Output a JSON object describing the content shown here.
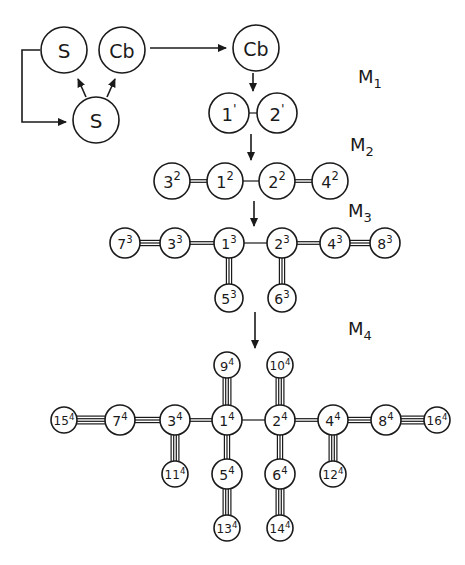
{
  "diagram": {
    "labels": [
      {
        "id": "M1",
        "text": "M",
        "sub": "1",
        "x": 358,
        "y": 83
      },
      {
        "id": "M2",
        "text": "M",
        "sub": "2",
        "x": 350,
        "y": 151
      },
      {
        "id": "M3",
        "text": "M",
        "sub": "3",
        "x": 348,
        "y": 217
      },
      {
        "id": "M4",
        "text": "M",
        "sub": "4",
        "x": 348,
        "y": 335
      }
    ],
    "nodes": [
      {
        "id": "S_top",
        "main": "S",
        "sup": "",
        "x": 64,
        "y": 50,
        "r": 23,
        "fs": 20
      },
      {
        "id": "Cb_top",
        "main": "Cb",
        "sup": "",
        "x": 122,
        "y": 50,
        "r": 23,
        "fs": 19
      },
      {
        "id": "S_bottom",
        "main": "S",
        "sup": "",
        "x": 96,
        "y": 120,
        "r": 23,
        "fs": 20
      },
      {
        "id": "Cb_right",
        "main": "Cb",
        "sup": "",
        "x": 256,
        "y": 48,
        "r": 23,
        "fs": 19
      },
      {
        "id": "1_1",
        "main": "1",
        "sup": "'",
        "x": 229,
        "y": 113,
        "r": 20,
        "fs": 18
      },
      {
        "id": "2_1",
        "main": "2",
        "sup": "'",
        "x": 277,
        "y": 113,
        "r": 20,
        "fs": 18
      },
      {
        "id": "3_2",
        "main": "3",
        "sup": "2",
        "x": 172,
        "y": 181,
        "r": 18,
        "fs": 16
      },
      {
        "id": "1_2",
        "main": "1",
        "sup": "2",
        "x": 225,
        "y": 181,
        "r": 18,
        "fs": 16
      },
      {
        "id": "2_2",
        "main": "2",
        "sup": "2",
        "x": 277,
        "y": 181,
        "r": 18,
        "fs": 16
      },
      {
        "id": "4_2",
        "main": "4",
        "sup": "2",
        "x": 330,
        "y": 181,
        "r": 18,
        "fs": 16
      },
      {
        "id": "7_3",
        "main": "7",
        "sup": "3",
        "x": 125,
        "y": 243,
        "r": 15,
        "fs": 14
      },
      {
        "id": "3_3",
        "main": "3",
        "sup": "3",
        "x": 175,
        "y": 243,
        "r": 15,
        "fs": 14
      },
      {
        "id": "1_3",
        "main": "1",
        "sup": "3",
        "x": 229,
        "y": 243,
        "r": 15,
        "fs": 14
      },
      {
        "id": "2_3",
        "main": "2",
        "sup": "3",
        "x": 282,
        "y": 243,
        "r": 15,
        "fs": 14
      },
      {
        "id": "4_3",
        "main": "4",
        "sup": "3",
        "x": 335,
        "y": 243,
        "r": 15,
        "fs": 14
      },
      {
        "id": "8_3",
        "main": "8",
        "sup": "3",
        "x": 385,
        "y": 243,
        "r": 15,
        "fs": 14
      },
      {
        "id": "5_3",
        "main": "5",
        "sup": "3",
        "x": 229,
        "y": 298,
        "r": 14,
        "fs": 14
      },
      {
        "id": "6_3",
        "main": "6",
        "sup": "3",
        "x": 282,
        "y": 298,
        "r": 14,
        "fs": 14
      },
      {
        "id": "9_4",
        "main": "9",
        "sup": "4",
        "x": 227,
        "y": 365,
        "r": 13,
        "fs": 13
      },
      {
        "id": "10_4",
        "main": "10",
        "sup": "4",
        "x": 280,
        "y": 365,
        "r": 13,
        "fs": 12
      },
      {
        "id": "15_4",
        "main": "15",
        "sup": "4",
        "x": 64,
        "y": 420,
        "r": 13,
        "fs": 12
      },
      {
        "id": "7_4",
        "main": "7",
        "sup": "4",
        "x": 120,
        "y": 420,
        "r": 15,
        "fs": 14
      },
      {
        "id": "3_4",
        "main": "3",
        "sup": "4",
        "x": 175,
        "y": 420,
        "r": 15,
        "fs": 14
      },
      {
        "id": "1_4",
        "main": "1",
        "sup": "4",
        "x": 227,
        "y": 420,
        "r": 15,
        "fs": 14
      },
      {
        "id": "2_4",
        "main": "2",
        "sup": "4",
        "x": 280,
        "y": 420,
        "r": 15,
        "fs": 14
      },
      {
        "id": "4_4",
        "main": "4",
        "sup": "4",
        "x": 333,
        "y": 420,
        "r": 15,
        "fs": 14
      },
      {
        "id": "8_4",
        "main": "8",
        "sup": "4",
        "x": 386,
        "y": 420,
        "r": 15,
        "fs": 14
      },
      {
        "id": "16_4",
        "main": "16",
        "sup": "4",
        "x": 437,
        "y": 420,
        "r": 13,
        "fs": 12
      },
      {
        "id": "11_4",
        "main": "11",
        "sup": "4",
        "x": 175,
        "y": 474,
        "r": 13,
        "fs": 12
      },
      {
        "id": "5_4",
        "main": "5",
        "sup": "4",
        "x": 227,
        "y": 474,
        "r": 15,
        "fs": 14
      },
      {
        "id": "6_4",
        "main": "6",
        "sup": "4",
        "x": 280,
        "y": 474,
        "r": 15,
        "fs": 14
      },
      {
        "id": "12_4",
        "main": "12",
        "sup": "4",
        "x": 333,
        "y": 474,
        "r": 13,
        "fs": 12
      },
      {
        "id": "13_4",
        "main": "13",
        "sup": "4",
        "x": 227,
        "y": 528,
        "r": 13,
        "fs": 12
      },
      {
        "id": "14_4",
        "main": "14",
        "sup": "4",
        "x": 280,
        "y": 528,
        "r": 13,
        "fs": 12
      }
    ],
    "bonds": [
      {
        "a": "1_1",
        "b": "2_1",
        "order": 1
      },
      {
        "a": "3_2",
        "b": "1_2",
        "order": 2
      },
      {
        "a": "1_2",
        "b": "2_2",
        "order": 1
      },
      {
        "a": "2_2",
        "b": "4_2",
        "order": 2
      },
      {
        "a": "7_3",
        "b": "3_3",
        "order": 3
      },
      {
        "a": "3_3",
        "b": "1_3",
        "order": 2
      },
      {
        "a": "1_3",
        "b": "2_3",
        "order": 1
      },
      {
        "a": "2_3",
        "b": "4_3",
        "order": 2
      },
      {
        "a": "4_3",
        "b": "8_3",
        "order": 3
      },
      {
        "a": "1_3",
        "b": "5_3",
        "order": 3
      },
      {
        "a": "2_3",
        "b": "6_3",
        "order": 3
      },
      {
        "a": "15_4",
        "b": "7_4",
        "order": 4
      },
      {
        "a": "7_4",
        "b": "3_4",
        "order": 3
      },
      {
        "a": "3_4",
        "b": "1_4",
        "order": 2
      },
      {
        "a": "1_4",
        "b": "2_4",
        "order": 1
      },
      {
        "a": "2_4",
        "b": "4_4",
        "order": 2
      },
      {
        "a": "4_4",
        "b": "8_4",
        "order": 3
      },
      {
        "a": "8_4",
        "b": "16_4",
        "order": 4
      },
      {
        "a": "9_4",
        "b": "1_4",
        "order": 4
      },
      {
        "a": "10_4",
        "b": "2_4",
        "order": 4
      },
      {
        "a": "3_4",
        "b": "11_4",
        "order": 4
      },
      {
        "a": "1_4",
        "b": "5_4",
        "order": 3
      },
      {
        "a": "2_4",
        "b": "6_4",
        "order": 3
      },
      {
        "a": "4_4",
        "b": "12_4",
        "order": 4
      },
      {
        "a": "5_4",
        "b": "13_4",
        "order": 4
      },
      {
        "a": "6_4",
        "b": "14_4",
        "order": 4
      }
    ],
    "arrows": [
      {
        "id": "loop-arrow",
        "points": [
          [
            40,
            50
          ],
          [
            22,
            50
          ],
          [
            22,
            122
          ],
          [
            66,
            122
          ]
        ]
      },
      {
        "id": "S-to-S-arrow",
        "points": [
          [
            86,
            97
          ],
          [
            78,
            79
          ]
        ]
      },
      {
        "id": "S-to-Cb-arrow",
        "points": [
          [
            107,
            97
          ],
          [
            115,
            79
          ]
        ]
      },
      {
        "id": "Cb-to-Cb-arrow",
        "points": [
          [
            150,
            48
          ],
          [
            226,
            48
          ]
        ]
      },
      {
        "id": "Cb-to-M1-arrow",
        "points": [
          [
            253,
            73
          ],
          [
            253,
            91
          ]
        ]
      },
      {
        "id": "M1-to-M2-arrow",
        "points": [
          [
            251,
            134
          ],
          [
            251,
            160
          ]
        ]
      },
      {
        "id": "M2-to-M3-arrow",
        "points": [
          [
            254,
            201
          ],
          [
            254,
            226
          ]
        ]
      },
      {
        "id": "M3-to-M4-arrow",
        "points": [
          [
            255,
            312
          ],
          [
            255,
            348
          ]
        ]
      }
    ]
  }
}
